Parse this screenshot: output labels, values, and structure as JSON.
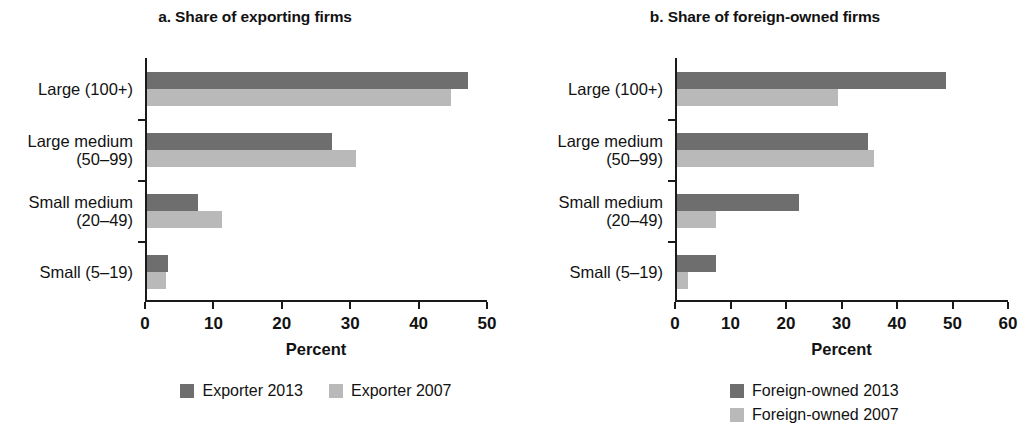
{
  "chart_data": [
    {
      "type": "bar",
      "orientation": "horizontal",
      "title": "a. Share of exporting firms",
      "xlabel": "Percent",
      "ylabel": "",
      "xlim": [
        0,
        50
      ],
      "xticks": [
        0,
        10,
        20,
        30,
        40,
        50
      ],
      "xtick_labels": [
        "0",
        "10",
        "20",
        "30",
        "40",
        "50"
      ],
      "grid": false,
      "legend_position": "bottom-center",
      "categories": [
        "Large (100+)",
        "Large medium\n(50–99)",
        "Small medium\n(20–49)",
        "Small (5–19)"
      ],
      "series": [
        {
          "name": "Exporter 2013",
          "color": "#6e6e6e",
          "values": [
            47,
            27,
            7.5,
            3
          ]
        },
        {
          "name": "Exporter 2007",
          "color": "#b9b9b9",
          "values": [
            44.5,
            30.5,
            11,
            2.8
          ]
        }
      ]
    },
    {
      "type": "bar",
      "orientation": "horizontal",
      "title": "b. Share of foreign-owned firms",
      "xlabel": "Percent",
      "ylabel": "",
      "xlim": [
        0,
        60
      ],
      "xticks": [
        0,
        10,
        20,
        30,
        40,
        50,
        60
      ],
      "xtick_labels": [
        "0",
        "10",
        "20",
        "30",
        "40",
        "50",
        "60"
      ],
      "grid": false,
      "legend_position": "bottom-left-stacked",
      "categories": [
        "Large (100+)",
        "Large medium\n(50–99)",
        "Small medium\n(20–49)",
        "Small (5–19)"
      ],
      "series": [
        {
          "name": "Foreign-owned 2013",
          "color": "#6e6e6e",
          "values": [
            48.5,
            34.5,
            22,
            7
          ]
        },
        {
          "name": "Foreign-owned 2007",
          "color": "#b9b9b9",
          "values": [
            29,
            35.5,
            7,
            2
          ]
        }
      ]
    }
  ],
  "panel_a": {
    "title": "a. Share of exporting firms",
    "axis_title": "Percent",
    "xtick_labels": [
      "0",
      "10",
      "20",
      "30",
      "40",
      "50"
    ],
    "categories": [
      "Large (100+)",
      "Large medium\n(50–99)",
      "Small medium\n(20–49)",
      "Small (5–19)"
    ],
    "legend": [
      {
        "label": "Exporter 2013",
        "color": "#6e6e6e"
      },
      {
        "label": "Exporter 2007",
        "color": "#b9b9b9"
      }
    ]
  },
  "panel_b": {
    "title": "b. Share of foreign-owned firms",
    "axis_title": "Percent",
    "xtick_labels": [
      "0",
      "10",
      "20",
      "30",
      "40",
      "50",
      "60"
    ],
    "categories": [
      "Large (100+)",
      "Large medium\n(50–99)",
      "Small medium\n(20–49)",
      "Small (5–19)"
    ],
    "legend": [
      {
        "label": "Foreign-owned 2013",
        "color": "#6e6e6e"
      },
      {
        "label": "Foreign-owned 2007",
        "color": "#b9b9b9"
      }
    ]
  }
}
